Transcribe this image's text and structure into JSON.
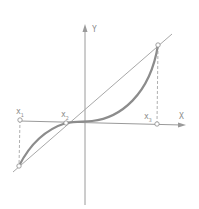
{
  "diagram": {
    "axes": {
      "x_label": "X",
      "y_label": "Y"
    },
    "points": [
      {
        "id": "x1",
        "label": "x",
        "subscript": "1"
      },
      {
        "id": "x2",
        "label": "x",
        "subscript": "2"
      },
      {
        "id": "x3",
        "label": "x",
        "subscript": "3"
      }
    ],
    "colors": {
      "axis": "#9a9a9a",
      "curve": "#8c8c8c",
      "secant": "#a8a8a8",
      "dashed": "#9a9a9a",
      "background": "#ffffff"
    }
  }
}
